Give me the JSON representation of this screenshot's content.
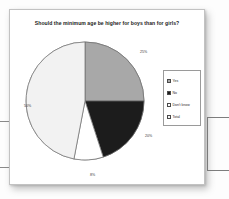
{
  "card": {
    "title": "Should the minimum age be higher for boys than for girls?"
  },
  "legend": {
    "items": [
      {
        "label": "Yes",
        "color": "#a8a8a8"
      },
      {
        "label": "No",
        "color": "#1c1c1c"
      },
      {
        "label": "Don't know",
        "color": "#ffffff"
      },
      {
        "label": "Total",
        "color": "#f2f2f2"
      }
    ]
  },
  "chart_data": {
    "type": "pie",
    "title": "Should the minimum age be higher for boys than for girls?",
    "categories": [
      "Yes",
      "No",
      "Don't know",
      "Total"
    ],
    "values": [
      25,
      20,
      8,
      47
    ],
    "labels": [
      "25%",
      "20%",
      "8%",
      "50%"
    ],
    "colors": [
      "#a8a8a8",
      "#1c1c1c",
      "#ffffff",
      "#f2f2f2"
    ],
    "start_angle": 0,
    "direction": "clockwise",
    "legend_position": "right",
    "grid": false,
    "xlabel": "",
    "ylabel": ""
  }
}
